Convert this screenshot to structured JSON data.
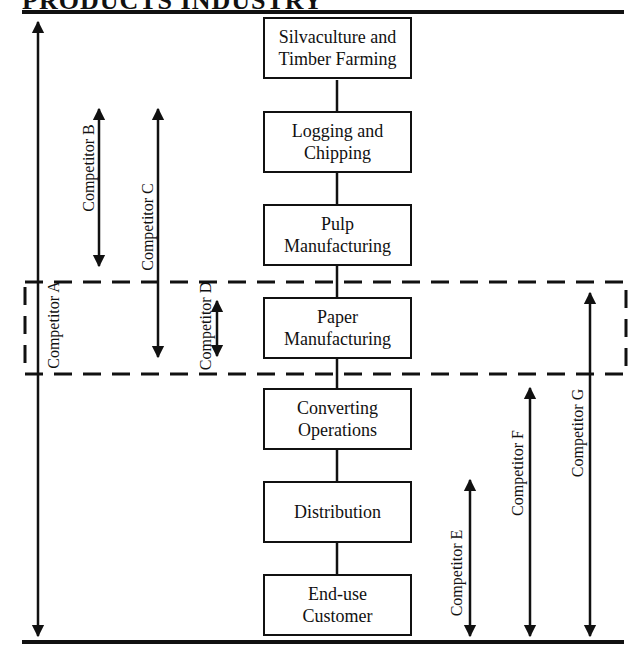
{
  "page_title": "PRODUCTS INDUSTRY",
  "value_chain": {
    "stages": [
      {
        "id": "silvaculture",
        "label": "Silvaculture and\nTimber Farming"
      },
      {
        "id": "logging",
        "label": "Logging and\nChipping"
      },
      {
        "id": "pulp",
        "label": "Pulp\nManufacturing"
      },
      {
        "id": "paper",
        "label": "Paper\nManufacturing"
      },
      {
        "id": "converting",
        "label": "Converting\nOperations"
      },
      {
        "id": "distribution",
        "label": "Distribution"
      },
      {
        "id": "end-use",
        "label": "End-use\nCustomer"
      }
    ],
    "highlighted_stage": "Paper Manufacturing"
  },
  "competitors": [
    {
      "id": "A",
      "label": "Competitor A",
      "span": [
        "Silvaculture and Timber Farming",
        "End-use Customer"
      ]
    },
    {
      "id": "B",
      "label": "Competitor B",
      "span": [
        "Logging and Chipping",
        "Pulp Manufacturing"
      ]
    },
    {
      "id": "C",
      "label": "Competitor C",
      "span": [
        "Logging and Chipping",
        "Paper Manufacturing"
      ]
    },
    {
      "id": "D",
      "label": "Competitor D",
      "span": [
        "Paper Manufacturing",
        "Paper Manufacturing"
      ]
    },
    {
      "id": "E",
      "label": "Competitor E",
      "span": [
        "Distribution",
        "End-use Customer"
      ]
    },
    {
      "id": "F",
      "label": "Competitor F",
      "span": [
        "Converting Operations",
        "End-use Customer"
      ]
    },
    {
      "id": "G",
      "label": "Competitor G",
      "span": [
        "Paper Manufacturing",
        "End-use Customer"
      ]
    }
  ],
  "colors": {
    "ink": "#111111",
    "background": "#ffffff"
  }
}
